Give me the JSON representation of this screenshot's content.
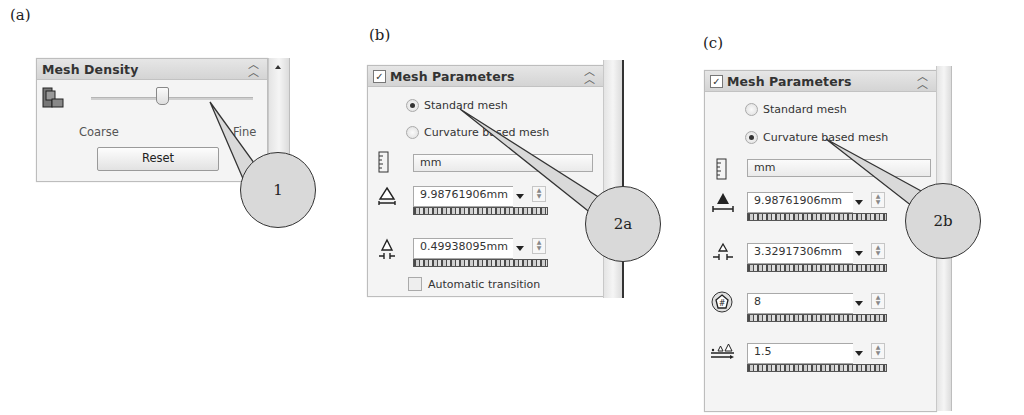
{
  "figure_labels": {
    "a": "(a)",
    "b": "(b)",
    "c": "(c)"
  },
  "panel_a": {
    "title": "Mesh Density",
    "collapse_icon": "double-chevron-up-icon",
    "slider": {
      "min_label": "Coarse",
      "max_label": "Fine",
      "position_percent": 52
    },
    "reset_label": "Reset",
    "callout": "1"
  },
  "panel_b": {
    "title": "Mesh Parameters",
    "checked": true,
    "radio_options": [
      {
        "label": "Standard mesh",
        "selected": true
      },
      {
        "label": "Curvature based mesh",
        "selected": false
      }
    ],
    "unit": "mm",
    "fields": [
      {
        "icon": "global-size-icon",
        "value": "9.98761906mm"
      },
      {
        "icon": "tolerance-icon",
        "value": "0.49938095mm"
      }
    ],
    "auto_transition_label": "Automatic transition",
    "auto_transition_checked": false,
    "callout": "2a"
  },
  "panel_c": {
    "title": "Mesh Parameters",
    "checked": true,
    "radio_options": [
      {
        "label": "Standard mesh",
        "selected": false
      },
      {
        "label": "Curvature based mesh",
        "selected": true
      }
    ],
    "unit": "mm",
    "fields": [
      {
        "icon": "max-element-size-icon",
        "value": "9.98761906mm"
      },
      {
        "icon": "min-element-size-icon",
        "value": "3.32917306mm"
      },
      {
        "icon": "min-elements-in-circle-icon",
        "value": "8"
      },
      {
        "icon": "element-growth-ratio-icon",
        "value": "1.5"
      }
    ],
    "callout": "2b"
  }
}
